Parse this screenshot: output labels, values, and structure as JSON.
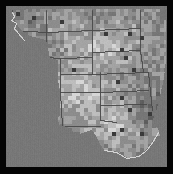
{
  "map": {
    "title": "Grayscale raster map of the western and central United States",
    "region": "Western and Central United States",
    "type": "raster-choropleth",
    "width": 173,
    "height": 174,
    "frame": {
      "border_color": "#050505",
      "border_width_left": 6,
      "border_width_top": 6,
      "border_width_right": 6,
      "border_width_bottom": 7
    },
    "palette": {
      "background": "#777777",
      "ocean": "#757575",
      "lowest": "#3a3a3a",
      "low": "#5e5e5e",
      "mid_low": "#767676",
      "mid": "#8c8c8c",
      "mid_high": "#a3a3a3",
      "high": "#bdbdbd",
      "highest": "#d6d6d6",
      "border_line": "#4a4a4a",
      "coast_line": "#d9d9d9"
    },
    "legend_visible": false,
    "labels_visible": false,
    "grid_visible": false,
    "cell_size": 4,
    "states": [
      {
        "name": "Washington",
        "abbr": "WA"
      },
      {
        "name": "Oregon",
        "abbr": "OR"
      },
      {
        "name": "Idaho",
        "abbr": "ID"
      },
      {
        "name": "Montana",
        "abbr": "MT"
      },
      {
        "name": "North Dakota",
        "abbr": "ND"
      },
      {
        "name": "Minnesota",
        "abbr": "MN"
      },
      {
        "name": "South Dakota",
        "abbr": "SD"
      },
      {
        "name": "Wyoming",
        "abbr": "WY"
      },
      {
        "name": "Nebraska",
        "abbr": "NE"
      },
      {
        "name": "Iowa",
        "abbr": "IA"
      },
      {
        "name": "Colorado",
        "abbr": "CO"
      },
      {
        "name": "Kansas",
        "abbr": "KS"
      },
      {
        "name": "Missouri",
        "abbr": "MO"
      },
      {
        "name": "New Mexico",
        "abbr": "NM"
      },
      {
        "name": "Oklahoma",
        "abbr": "OK"
      },
      {
        "name": "Arkansas",
        "abbr": "AR"
      },
      {
        "name": "Texas",
        "abbr": "TX"
      },
      {
        "name": "Louisiana",
        "abbr": "LA"
      }
    ],
    "state_border_paths": [
      [
        [
          12,
          10
        ],
        [
          12,
          30
        ],
        [
          46,
          32
        ]
      ],
      [
        [
          46,
          10
        ],
        [
          46,
          32
        ]
      ],
      [
        [
          46,
          32
        ],
        [
          46,
          57
        ],
        [
          60,
          58
        ]
      ],
      [
        [
          46,
          32
        ],
        [
          92,
          30
        ]
      ],
      [
        [
          92,
          10
        ],
        [
          92,
          30
        ]
      ],
      [
        [
          92,
          30
        ],
        [
          140,
          28
        ]
      ],
      [
        [
          140,
          10
        ],
        [
          140,
          28
        ]
      ],
      [
        [
          92,
          30
        ],
        [
          92,
          52
        ],
        [
          140,
          50
        ]
      ],
      [
        [
          140,
          28
        ],
        [
          140,
          50
        ]
      ],
      [
        [
          92,
          52
        ],
        [
          92,
          74
        ],
        [
          148,
          72
        ]
      ],
      [
        [
          140,
          50
        ],
        [
          143,
          72
        ]
      ],
      [
        [
          60,
          58
        ],
        [
          60,
          92
        ]
      ],
      [
        [
          60,
          58
        ],
        [
          92,
          57
        ]
      ],
      [
        [
          60,
          74
        ],
        [
          92,
          74
        ]
      ],
      [
        [
          60,
          92
        ],
        [
          100,
          92
        ]
      ],
      [
        [
          100,
          72
        ],
        [
          100,
          120
        ]
      ],
      [
        [
          100,
          92
        ],
        [
          148,
          90
        ]
      ],
      [
        [
          100,
          105
        ],
        [
          146,
          104
        ]
      ],
      [
        [
          148,
          72
        ],
        [
          152,
          110
        ]
      ],
      [
        [
          60,
          92
        ],
        [
          62,
          126
        ]
      ],
      [
        [
          62,
          126
        ],
        [
          100,
          126
        ]
      ],
      [
        [
          100,
          120
        ],
        [
          116,
          122
        ]
      ]
    ],
    "coast_paths": [
      [
        [
          12,
          12
        ],
        [
          14,
          16
        ],
        [
          11,
          20
        ],
        [
          16,
          23
        ],
        [
          14,
          28
        ],
        [
          19,
          34
        ],
        [
          24,
          40
        ]
      ],
      [
        [
          104,
          150
        ],
        [
          116,
          152
        ],
        [
          126,
          158
        ],
        [
          138,
          156
        ],
        [
          146,
          150
        ],
        [
          152,
          142
        ],
        [
          158,
          132
        ]
      ]
    ],
    "cities": [
      {
        "name": "Seattle",
        "x": 16,
        "y": 14
      },
      {
        "name": "Spokane",
        "x": 32,
        "y": 18
      },
      {
        "name": "Billings",
        "x": 62,
        "y": 22
      },
      {
        "name": "Bismarck",
        "x": 104,
        "y": 34
      },
      {
        "name": "Fargo",
        "x": 128,
        "y": 32
      },
      {
        "name": "Minneapolis",
        "x": 140,
        "y": 38
      },
      {
        "name": "Sioux Falls",
        "x": 122,
        "y": 48
      },
      {
        "name": "Omaha",
        "x": 126,
        "y": 58
      },
      {
        "name": "Denver",
        "x": 72,
        "y": 70
      },
      {
        "name": "Kansas City",
        "x": 134,
        "y": 70
      },
      {
        "name": "Wichita",
        "x": 118,
        "y": 82
      },
      {
        "name": "Oklahoma City",
        "x": 122,
        "y": 96
      },
      {
        "name": "Dallas",
        "x": 130,
        "y": 108
      },
      {
        "name": "Houston",
        "x": 140,
        "y": 134
      },
      {
        "name": "Austin",
        "x": 120,
        "y": 128
      },
      {
        "name": "San Antonio",
        "x": 112,
        "y": 134
      },
      {
        "name": "New Orleans",
        "x": 160,
        "y": 124
      }
    ]
  },
  "chart_data": {
    "type": "heatmap",
    "title": "Grayscale raster map of the western and central United States",
    "xlabel": "",
    "ylabel": "",
    "legend": [],
    "colorscale": [
      "#3a3a3a",
      "#5e5e5e",
      "#767676",
      "#8c8c8c",
      "#a3a3a3",
      "#bdbdbd",
      "#d6d6d6"
    ],
    "value_range": [
      0,
      6
    ],
    "cell_size": 4,
    "nodata_color": "#777777",
    "grid": [
      "...................................................",
      "...................................................",
      "..ooo..............................................",
      "..o4455443332223344433445544333322222222222222222..",
      "..o3456654433223445554334455443322222222222222222..",
      "..oo4566443322345556443345544332222222222222222222.",
      "...o45543322234556644334554433222222222222222222...",
      "...oo4433222234556543334554433222222222222222222...",
      "....o4332222334455543334554433222222222222222222...",
      "....oo33222233445544333455443322222222222222222....",
      ".....o3222223344554433345544332222222222222222.....",
      ".....oo2222334455443334554433222222222222222.......",
      "......o222233445544333455443322222222222222........",
      "......oo22334455443334554433222222222222..........."
    ]
  }
}
